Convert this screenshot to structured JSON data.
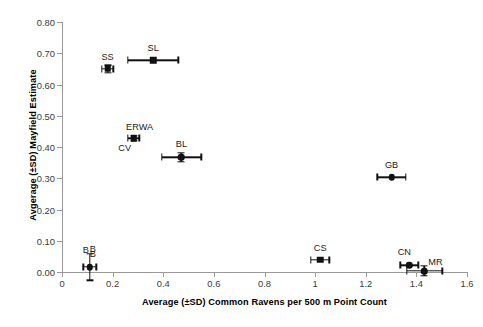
{
  "chart_data": {
    "type": "scatter",
    "title": "",
    "xlabel": "Average (±SD) Common Ravens per 500 m Point Count",
    "ylabel": "Avgerage (±SD) Mayfield Estimate",
    "xlim": [
      0,
      1.6
    ],
    "ylim": [
      0.0,
      0.8
    ],
    "xticks": [
      "0",
      "0.2",
      "0.4",
      "0.6",
      "0.8",
      "1",
      "1.2",
      "1.4",
      "1.6"
    ],
    "xtick_values": [
      0,
      0.2,
      0.4,
      0.6,
      0.8,
      1.0,
      1.2,
      1.4,
      1.6
    ],
    "yticks": [
      "0.00",
      "0.10",
      "0.20",
      "0.30",
      "0.40",
      "0.50",
      "0.60",
      "0.70",
      "0.80"
    ],
    "ytick_values": [
      0.0,
      0.1,
      0.2,
      0.3,
      0.4,
      0.5,
      0.6,
      0.7,
      0.8
    ],
    "grid": false,
    "legend": "none",
    "marker_color": "#111111",
    "axis_color": "#9a9a9a",
    "error_bars": "x and y (±SD)",
    "points": [
      {
        "label": "SS",
        "x": 0.18,
        "y": 0.65,
        "xerr": 0.022,
        "yerr": 0.012,
        "label_dx": 0,
        "label_dy": -17,
        "marker": "square"
      },
      {
        "label": "SL",
        "x": 0.36,
        "y": 0.678,
        "xerr": 0.1,
        "yerr": 0.0,
        "label_dx": 0,
        "label_dy": -17,
        "marker": "square"
      },
      {
        "label": "ERWA",
        "x": 0.283,
        "y": 0.428,
        "xerr": 0.022,
        "yerr": 0.008,
        "label_dx": 6,
        "label_dy": -16,
        "marker": "square"
      },
      {
        "label": "CV",
        "x": 0.283,
        "y": 0.428,
        "xerr": 0.0,
        "yerr": 0.0,
        "label_dx": -9,
        "label_dy": 5,
        "marker": "none"
      },
      {
        "label": "BL",
        "x": 0.472,
        "y": 0.367,
        "xerr": 0.078,
        "yerr": 0.014,
        "label_dx": 0,
        "label_dy": -18,
        "marker": "round"
      },
      {
        "label": "GB",
        "x": 1.302,
        "y": 0.303,
        "xerr": 0.057,
        "yerr": 0.0,
        "label_dx": 0,
        "label_dy": -17,
        "marker": "round"
      },
      {
        "label": "CS",
        "x": 1.02,
        "y": 0.04,
        "xerr": 0.036,
        "yerr": 0.0,
        "label_dx": 0,
        "label_dy": -17,
        "marker": "square"
      },
      {
        "label": "CN",
        "x": 1.372,
        "y": 0.021,
        "xerr": 0.036,
        "yerr": 0.0,
        "label_dx": -5,
        "label_dy": -18,
        "marker": "round"
      },
      {
        "label": "MR",
        "x": 1.432,
        "y": 0.003,
        "xerr": 0.07,
        "yerr": 0.016,
        "label_dx": 11,
        "label_dy": -14,
        "marker": "round"
      },
      {
        "label": "B",
        "x": 0.11,
        "y": 0.016,
        "xerr": 0.026,
        "yerr": 0.042,
        "label_dx": -4,
        "label_dy": -22,
        "marker": "round"
      },
      {
        "label": "B",
        "x": 0.11,
        "y": 0.016,
        "xerr": 0.0,
        "yerr": 0.0,
        "label_dx": 3,
        "label_dy": -23,
        "marker": "none"
      },
      {
        "label": "B",
        "x": 0.11,
        "y": 0.016,
        "xerr": 0.0,
        "yerr": 0.0,
        "label_dx": 3,
        "label_dy": -18,
        "marker": "none"
      }
    ]
  }
}
